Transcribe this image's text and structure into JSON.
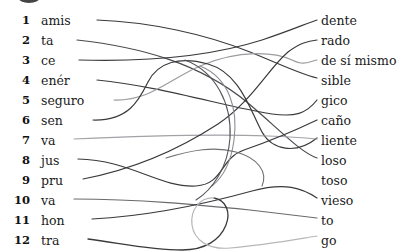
{
  "exercise": {
    "type": "matching-activity",
    "title": "",
    "rows": [
      {
        "number": "1",
        "left": "amis",
        "right": "dente"
      },
      {
        "number": "2",
        "left": "ta",
        "right": "rado"
      },
      {
        "number": "3",
        "left": "ce",
        "right": "de sí mismo"
      },
      {
        "number": "4",
        "left": "enér",
        "right": "sible"
      },
      {
        "number": "5",
        "left": "seguro",
        "right": "gico"
      },
      {
        "number": "6",
        "left": "sen",
        "right": "caño"
      },
      {
        "number": "7",
        "left": "va",
        "right": "liente"
      },
      {
        "number": "8",
        "left": "jus",
        "right": "loso"
      },
      {
        "number": "9",
        "left": "pru",
        "right": "toso"
      },
      {
        "number": "10",
        "left": "va",
        "right": "vieso"
      },
      {
        "number": "11",
        "left": "hon",
        "right": "to"
      },
      {
        "number": "12",
        "left": "tra",
        "right": "go"
      }
    ],
    "connections": [
      {
        "from": "1",
        "to": "sible",
        "ink": "dark"
      },
      {
        "from": "2",
        "to": "loso",
        "ink": "dark"
      },
      {
        "from": "3",
        "to": "dente",
        "ink": "dark"
      },
      {
        "from": "4",
        "to": "gico",
        "ink": "dark"
      },
      {
        "from": "5",
        "to": "de sí mismo",
        "ink": "light"
      },
      {
        "from": "6",
        "to": "toso",
        "ink": "dark"
      },
      {
        "from": "7",
        "to": "liente",
        "ink": "light"
      },
      {
        "from": "8",
        "to": "caño",
        "ink": "dark"
      },
      {
        "from": "9",
        "to": "rado",
        "ink": "dark"
      },
      {
        "from": "10",
        "to": "to",
        "ink": "medium"
      },
      {
        "from": "11",
        "to": "vieso",
        "ink": "dark"
      },
      {
        "from": "12",
        "to": "go",
        "ink": "light"
      }
    ]
  },
  "ink": {
    "dark": "#3a3a3c",
    "medium": "#5e5e62",
    "light": "#9b9ba0",
    "text": "#1b1b1b",
    "paper": "#ffffff"
  }
}
